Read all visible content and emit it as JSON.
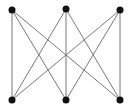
{
  "diagram": {
    "type": "graph",
    "name": "K3,3",
    "background": "#ffffff",
    "edge_color": "#6a6a6a",
    "node_color": "#111111",
    "node_radius": 3.5,
    "edge_width": 0.9,
    "nodes": [
      {
        "id": "a1",
        "x": 12,
        "y": 10
      },
      {
        "id": "a2",
        "x": 66,
        "y": 9
      },
      {
        "id": "a3",
        "x": 120,
        "y": 10
      },
      {
        "id": "b1",
        "x": 12,
        "y": 100
      },
      {
        "id": "b2",
        "x": 66,
        "y": 100
      },
      {
        "id": "b3",
        "x": 120,
        "y": 100
      }
    ],
    "edges": [
      [
        "a1",
        "b1"
      ],
      [
        "a1",
        "b2"
      ],
      [
        "a1",
        "b3"
      ],
      [
        "a2",
        "b1"
      ],
      [
        "a2",
        "b2"
      ],
      [
        "a2",
        "b3"
      ],
      [
        "a3",
        "b1"
      ],
      [
        "a3",
        "b2"
      ],
      [
        "a3",
        "b3"
      ]
    ]
  }
}
